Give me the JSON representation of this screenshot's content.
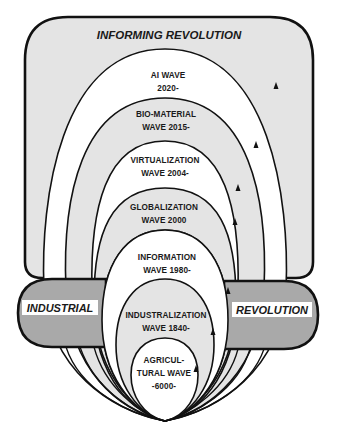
{
  "diagram": {
    "title": "INFORMING REVOLUTION",
    "band": {
      "left_label": "INDUSTRIAL",
      "right_label": "REVOLUTION"
    },
    "waves": [
      {
        "id": "ai",
        "line1": "AI WAVE",
        "line2": "2020-",
        "line3": ""
      },
      {
        "id": "bio",
        "line1": "BIO-MATERIAL",
        "line2": "WAVE 2015-",
        "line3": ""
      },
      {
        "id": "virtualization",
        "line1": "VIRTUALIZATION",
        "line2": "WAVE 2004-",
        "line3": ""
      },
      {
        "id": "globalization",
        "line1": "GLOBALIZATION",
        "line2": "WAVE 2000",
        "line3": ""
      },
      {
        "id": "information",
        "line1": "INFORMATION",
        "line2": "WAVE 1980-",
        "line3": ""
      },
      {
        "id": "industrialization",
        "line1": "INDUSTRALIZATION",
        "line2": "WAVE 1840-",
        "line3": ""
      },
      {
        "id": "agricultural",
        "line1": "AGRICUL-",
        "line2": "TURAL WAVE",
        "line3": "-6000-"
      }
    ],
    "colors": {
      "box_fill": "#e4e4e4",
      "band_fill": "#a9a9a9",
      "wave_light": "#e4e4e4",
      "wave_white": "#ffffff",
      "stroke": "#111111"
    }
  }
}
